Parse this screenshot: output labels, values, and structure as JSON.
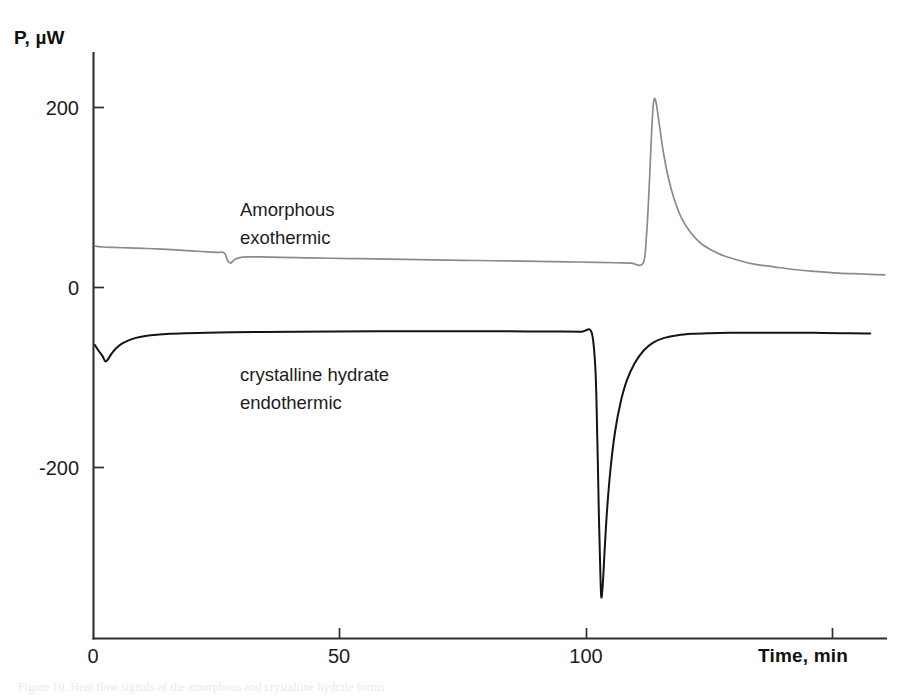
{
  "figure": {
    "background_color": "#ffffff",
    "caption_partial": "Figure 10.  Heat flow signals of the amorphous and crystalline hydrate forms"
  },
  "chart_data": {
    "type": "line",
    "title": "",
    "subtitle": "",
    "xlabel": "Time, min",
    "ylabel": "P, µW",
    "xlim": [
      0,
      160
    ],
    "ylim": [
      -400,
      260
    ],
    "xticks": [
      0,
      50,
      100,
      150
    ],
    "xticklabels": [
      "0",
      "50",
      "100",
      ""
    ],
    "yticks": [
      200,
      0,
      -200
    ],
    "yticklabels": [
      "200",
      "0",
      "-200"
    ],
    "grid": false,
    "legend_position": "inline-annotations",
    "axis_style": "left-and-bottom-spines",
    "series": [
      {
        "name": "Amorphous exothermic",
        "color": "#8b8b8b",
        "label_lines": [
          "Amorphous",
          "exothermic"
        ],
        "peak_time_min": 113.5,
        "peak_value_uW": 210,
        "baseline_start_uW": 46,
        "baseline_end_uW": 14,
        "points": [
          [
            0.4,
            46
          ],
          [
            2,
            45
          ],
          [
            4,
            44.5
          ],
          [
            7,
            44
          ],
          [
            10,
            43.5
          ],
          [
            13,
            43
          ],
          [
            16,
            42
          ],
          [
            19,
            41
          ],
          [
            22,
            40
          ],
          [
            25,
            39
          ],
          [
            26.5,
            38.5
          ],
          [
            27.2,
            30
          ],
          [
            27.8,
            27
          ],
          [
            28.6,
            31
          ],
          [
            29.5,
            33
          ],
          [
            31,
            34
          ],
          [
            34,
            34
          ],
          [
            38,
            33.5
          ],
          [
            43,
            33
          ],
          [
            48,
            32.5
          ],
          [
            54,
            32
          ],
          [
            60,
            31.5
          ],
          [
            66,
            31
          ],
          [
            72,
            30.5
          ],
          [
            78,
            30
          ],
          [
            84,
            29.5
          ],
          [
            90,
            29
          ],
          [
            96,
            28.5
          ],
          [
            102,
            28
          ],
          [
            106,
            27.5
          ],
          [
            109,
            27
          ],
          [
            111.5,
            27
          ],
          [
            112.2,
            60
          ],
          [
            112.7,
            110
          ],
          [
            113.1,
            160
          ],
          [
            113.5,
            200
          ],
          [
            113.8,
            210
          ],
          [
            114.2,
            203
          ],
          [
            114.8,
            180
          ],
          [
            115.6,
            150
          ],
          [
            116.6,
            122
          ],
          [
            117.8,
            98
          ],
          [
            119.2,
            78
          ],
          [
            121,
            62
          ],
          [
            123,
            50
          ],
          [
            125.5,
            41
          ],
          [
            128,
            35
          ],
          [
            131,
            30
          ],
          [
            134,
            26
          ],
          [
            138,
            23
          ],
          [
            142,
            20
          ],
          [
            146,
            18
          ],
          [
            151,
            16
          ],
          [
            156,
            15
          ],
          [
            160.5,
            14
          ]
        ]
      },
      {
        "name": "crystalline hydrate endothermic",
        "color": "#141414",
        "label_lines": [
          "crystalline hydrate",
          "endothermic"
        ],
        "trough_time_min": 103.0,
        "trough_value_uW": -344,
        "baseline_start_uW": -65,
        "baseline_end_uW": -51,
        "points": [
          [
            0.3,
            -64
          ],
          [
            1,
            -70
          ],
          [
            1.8,
            -76
          ],
          [
            2.4,
            -82
          ],
          [
            2.9,
            -80
          ],
          [
            3.6,
            -74
          ],
          [
            4.5,
            -68
          ],
          [
            5.6,
            -63
          ],
          [
            7,
            -59
          ],
          [
            8.6,
            -56
          ],
          [
            10.5,
            -54
          ],
          [
            12.8,
            -52.5
          ],
          [
            15.5,
            -51.5
          ],
          [
            19,
            -50.8
          ],
          [
            23,
            -50.2
          ],
          [
            28,
            -49.8
          ],
          [
            34,
            -49.4
          ],
          [
            41,
            -49.1
          ],
          [
            49,
            -48.9
          ],
          [
            58,
            -48.7
          ],
          [
            68,
            -48.6
          ],
          [
            78,
            -48.6
          ],
          [
            88,
            -48.8
          ],
          [
            95,
            -49
          ],
          [
            99,
            -49.2
          ],
          [
            101,
            -49.4
          ],
          [
            101.8,
            -90
          ],
          [
            102.2,
            -170
          ],
          [
            102.5,
            -250
          ],
          [
            102.8,
            -315
          ],
          [
            103.0,
            -344
          ],
          [
            103.3,
            -330
          ],
          [
            103.7,
            -290
          ],
          [
            104.2,
            -245
          ],
          [
            104.9,
            -200
          ],
          [
            105.8,
            -160
          ],
          [
            106.9,
            -128
          ],
          [
            108.2,
            -103
          ],
          [
            109.8,
            -84
          ],
          [
            111.6,
            -70
          ],
          [
            113.6,
            -61
          ],
          [
            115.8,
            -56
          ],
          [
            118.5,
            -53
          ],
          [
            121.5,
            -51.5
          ],
          [
            125,
            -50.8
          ],
          [
            129,
            -50.4
          ],
          [
            134,
            -50.2
          ],
          [
            140,
            -50.2
          ],
          [
            146,
            -50.4
          ],
          [
            152,
            -50.7
          ],
          [
            157,
            -51
          ],
          [
            157.5,
            -51
          ]
        ]
      }
    ]
  },
  "annotations": [
    {
      "id": "amorphous-label",
      "lines": [
        "Amorphous",
        "exothermic"
      ]
    },
    {
      "id": "crystalline-label",
      "lines": [
        "crystalline hydrate",
        "endothermic"
      ]
    }
  ],
  "axis": {
    "y_title": "P, µW",
    "x_title": "Time, min",
    "y_tick_labels": [
      "200",
      "0",
      "-200"
    ],
    "x_tick_labels": [
      "0",
      "50",
      "100"
    ]
  }
}
